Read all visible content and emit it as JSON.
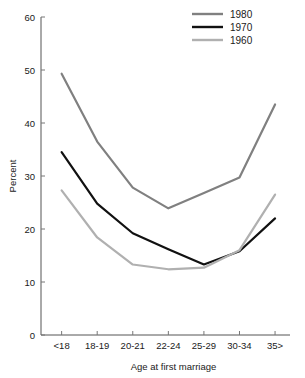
{
  "chart_data": {
    "type": "line",
    "title": "",
    "xlabel": "Age at first marriage",
    "ylabel": "Percent",
    "categories": [
      "<18",
      "18-19",
      "20-21",
      "22-24",
      "25-29",
      "30-34",
      "35>"
    ],
    "ylim": [
      0,
      60
    ],
    "yticks": [
      0,
      10,
      20,
      30,
      40,
      50,
      60
    ],
    "grid": false,
    "legend_position": "top-right",
    "series": [
      {
        "name": "1980",
        "color": "#808080",
        "values": [
          49.3,
          36.5,
          27.8,
          23.9,
          26.8,
          29.7,
          43.5
        ]
      },
      {
        "name": "1970",
        "color": "#111111",
        "values": [
          34.5,
          24.8,
          19.2,
          16.2,
          13.3,
          15.8,
          22.0
        ]
      },
      {
        "name": "1960",
        "color": "#b0b0b0",
        "values": [
          27.3,
          18.4,
          13.3,
          12.4,
          12.7,
          16.0,
          26.5
        ]
      }
    ]
  },
  "plot": {
    "left": 41,
    "right": 290,
    "top": 17,
    "bottom": 335
  },
  "legend": {
    "x": 192,
    "y": 14,
    "row_height": 13,
    "swatch_width": 31
  }
}
